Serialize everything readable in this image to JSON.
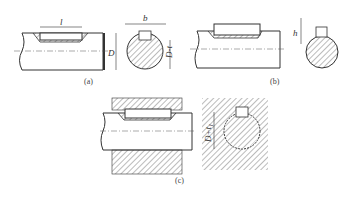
{
  "figure": {
    "panels": [
      {
        "id": "a",
        "caption": "(a)",
        "dim_labels": {
          "length": "l",
          "width": "b",
          "diameter": "D",
          "depth": "D-t"
        }
      },
      {
        "id": "b",
        "caption": "(b)",
        "dim_labels": {
          "height": "h"
        }
      },
      {
        "id": "c",
        "caption": "(c)",
        "dim_labels": {
          "hub_depth": "D+t₁"
        }
      }
    ]
  }
}
